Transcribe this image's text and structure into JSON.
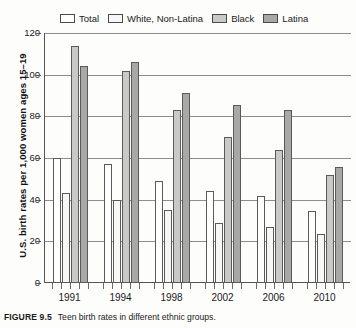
{
  "figure": {
    "caption_tag": "FIGURE 9.5",
    "caption_text": "Teen birth rates in different ethnic groups."
  },
  "legend": {
    "position": "top",
    "items": [
      {
        "label": "Total",
        "color": "#ffffff"
      },
      {
        "label": "White, Non-Latina",
        "color": "#f7f7f5"
      },
      {
        "label": "Black",
        "color": "#c9c9c7"
      },
      {
        "label": "Latina",
        "color": "#a8a8a6"
      }
    ]
  },
  "axes": {
    "ylabel": "U.S. birth rates per 1,000 women ages 15–19",
    "yticks": [
      "0",
      "20",
      "40",
      "60",
      "80",
      "100",
      "120"
    ],
    "xlabel": "",
    "xticks": [
      "1991",
      "1994",
      "1998",
      "2002",
      "2006",
      "2010"
    ]
  },
  "chart_data": {
    "type": "bar",
    "title": "Teen birth rates in different ethnic groups",
    "xlabel": "",
    "ylabel": "U.S. birth rates per 1,000 women ages 15-19",
    "ylim": [
      0,
      120
    ],
    "ytick_step": 20,
    "grid": true,
    "legend_position": "top",
    "categories": [
      "1991",
      "1994",
      "1998",
      "2002",
      "2006",
      "2010"
    ],
    "series": [
      {
        "name": "Total",
        "color": "#ffffff",
        "values": [
          60.0,
          57.0,
          49.0,
          44.0,
          42.0,
          34.5
        ]
      },
      {
        "name": "White, Non-Latina",
        "color": "#f7f7f5",
        "values": [
          43.0,
          40.0,
          35.0,
          29.0,
          27.0,
          23.5
        ]
      },
      {
        "name": "Black",
        "color": "#c9c9c7",
        "values": [
          114.0,
          102.0,
          83.0,
          70.0,
          64.0,
          52.0
        ]
      },
      {
        "name": "Latina",
        "color": "#a8a8a6",
        "values": [
          104.0,
          106.0,
          91.0,
          85.5,
          83.0,
          55.5
        ]
      }
    ]
  }
}
